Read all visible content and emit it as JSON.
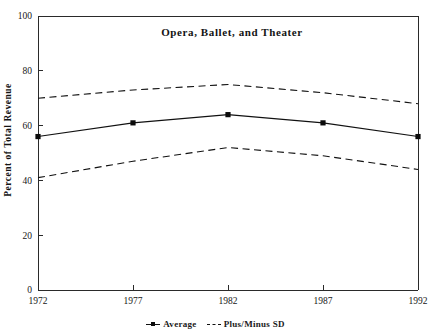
{
  "figure": {
    "caption_remnant": "",
    "legend": {
      "entries": [
        {
          "label": "Average",
          "style": "solid-with-marker"
        },
        {
          "label": "Plus/Minus SD",
          "style": "dashed"
        }
      ]
    }
  },
  "chart_data": {
    "type": "line",
    "title": "Opera, Ballet, and Theater",
    "xlabel": "",
    "ylabel": "Percent of Total Revenue",
    "x": [
      1972,
      1977,
      1982,
      1987,
      1992
    ],
    "categories": [
      "1972",
      "1977",
      "1982",
      "1987",
      "1992"
    ],
    "xlim": [
      1972,
      1992
    ],
    "ylim": [
      0,
      100
    ],
    "yticks": [
      0,
      20,
      40,
      60,
      80,
      100
    ],
    "ytick_labels": [
      "0",
      "20",
      "40",
      "60",
      "80",
      "100"
    ],
    "xticks": [
      1972,
      1977,
      1982,
      1987,
      1992
    ],
    "xtick_labels": [
      "1972",
      "1977",
      "1982",
      "1987",
      "1992"
    ],
    "grid": false,
    "legend_position": "bottom-outside",
    "series": [
      {
        "name": "Average",
        "style": "solid",
        "marker": "square",
        "values": [
          56,
          61,
          64,
          61,
          56
        ]
      },
      {
        "name": "Plus SD",
        "style": "dashed",
        "marker": "none",
        "values": [
          70,
          73,
          75,
          72,
          68
        ]
      },
      {
        "name": "Minus SD",
        "style": "dashed",
        "marker": "none",
        "values": [
          41,
          47,
          52,
          49,
          44
        ]
      }
    ]
  }
}
